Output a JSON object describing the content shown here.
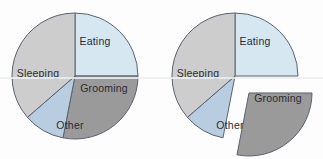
{
  "figure": {
    "background_color": "#fdfdfd",
    "stroke_color": "#5a6270",
    "label_color": "#2b2b33"
  },
  "chart_data": [
    {
      "id": "pie-standard",
      "type": "pie",
      "title": "",
      "exploded": false,
      "legend": "none",
      "labels_position": "inside",
      "start_angle_deg": -90,
      "direction": "clockwise",
      "categories": [
        "Eating",
        "Grooming",
        "Other",
        "Sleeping"
      ],
      "values": [
        25,
        28,
        10.5,
        36.5
      ],
      "colors": [
        "#d6e7f2",
        "#9a9a9a",
        "#b9cde0",
        "#cdcdcd"
      ],
      "slices": [
        {
          "label": "Eating",
          "value": 25,
          "color": "#d6e7f2",
          "start_deg": -90,
          "sweep_deg": 90,
          "exploded": false
        },
        {
          "label": "Grooming",
          "value": 28,
          "color": "#9a9a9a",
          "start_deg": 0,
          "sweep_deg": 101,
          "exploded": false
        },
        {
          "label": "Other",
          "value": 10.5,
          "color": "#b9cde0",
          "start_deg": 101,
          "sweep_deg": 38,
          "exploded": false
        },
        {
          "label": "Sleeping",
          "value": 36.5,
          "color": "#cdcdcd",
          "start_deg": 139,
          "sweep_deg": 131,
          "exploded": false
        }
      ]
    },
    {
      "id": "pie-exploded",
      "type": "pie",
      "title": "",
      "exploded": true,
      "exploded_slice": "Grooming",
      "legend": "none",
      "labels_position": "inside",
      "start_angle_deg": -90,
      "direction": "clockwise",
      "categories": [
        "Eating",
        "Grooming",
        "Other",
        "Sleeping"
      ],
      "values": [
        25,
        28,
        10.5,
        36.5
      ],
      "colors": [
        "#d6e7f2",
        "#9a9a9a",
        "#b9cde0",
        "#cdcdcd"
      ],
      "slices": [
        {
          "label": "Eating",
          "value": 25,
          "color": "#d6e7f2",
          "start_deg": -90,
          "sweep_deg": 90,
          "exploded": false
        },
        {
          "label": "Grooming",
          "value": 28,
          "color": "#9a9a9a",
          "start_deg": 0,
          "sweep_deg": 101,
          "exploded": true
        },
        {
          "label": "Other",
          "value": 10.5,
          "color": "#b9cde0",
          "start_deg": 101,
          "sweep_deg": 38,
          "exploded": false
        },
        {
          "label": "Sleeping",
          "value": 36.5,
          "color": "#cdcdcd",
          "start_deg": 139,
          "sweep_deg": 131,
          "exploded": false
        }
      ]
    }
  ],
  "labels": {
    "eating": "Eating",
    "grooming": "Grooming",
    "other": "Other",
    "sleeping": "Sleeping"
  }
}
